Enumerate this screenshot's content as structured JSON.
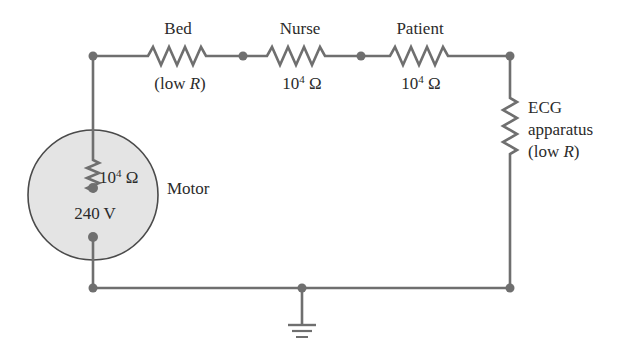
{
  "diagram": {
    "type": "circuit",
    "colors": {
      "wire": "#6f6f6f",
      "motor_fill": "#e4e4e4",
      "motor_stroke": "#4a4a4a",
      "text": "#2b2b2b"
    },
    "components": {
      "bed": {
        "name": "Bed",
        "value_prefix": "(low ",
        "value_var": "R",
        "value_suffix": ")"
      },
      "nurse": {
        "name": "Nurse",
        "value_base": "10",
        "value_exp": "4",
        "value_unit": " Ω"
      },
      "patient": {
        "name": "Patient",
        "value_base": "10",
        "value_exp": "4",
        "value_unit": " Ω"
      },
      "ecg": {
        "name": "ECG",
        "line2": "apparatus",
        "value_prefix": "(low ",
        "value_var": "R",
        "value_suffix": ")"
      },
      "motor": {
        "name": "Motor",
        "resistance_base": "10",
        "resistance_exp": "4",
        "resistance_unit": " Ω",
        "voltage": "240 V"
      },
      "ground": {
        "symbol": "ground"
      }
    }
  }
}
